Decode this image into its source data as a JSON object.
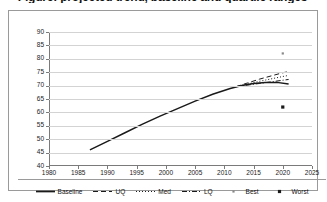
{
  "chart_data": {
    "type": "line",
    "title": "Figure: projected trend, baseline and quartile ranges",
    "xlabel": "",
    "ylabel": "",
    "xlim": [
      1980,
      2025
    ],
    "ylim": [
      40,
      90
    ],
    "grid": true,
    "legend_position": "bottom",
    "xticks": [
      "1980",
      "1985",
      "1990",
      "1995",
      "2000",
      "2005",
      "2010",
      "2015",
      "2020",
      "2025"
    ],
    "yticks": [
      "40",
      "45",
      "50",
      "55",
      "60",
      "65",
      "70",
      "75",
      "80",
      "85",
      "90"
    ],
    "series": [
      {
        "name": "Baseline",
        "style": "solid",
        "color": "#1a1a1a",
        "x": [
          1987,
          1990,
          1993,
          1996,
          1999,
          2002,
          2005,
          2008,
          2011,
          2013,
          2015,
          2017,
          2019,
          2021
        ],
        "values": [
          46.0,
          49.2,
          52.4,
          55.6,
          58.6,
          61.4,
          64.2,
          66.8,
          68.9,
          70.0,
          70.8,
          71.2,
          71.2,
          70.6
        ]
      },
      {
        "name": "UQ",
        "style": "dashed",
        "color": "#1a1a1a",
        "x": [
          2012,
          2014,
          2016,
          2018,
          2020,
          2021
        ],
        "values": [
          69.6,
          71.0,
          72.4,
          73.6,
          74.8,
          75.2
        ]
      },
      {
        "name": "Med",
        "style": "dotted",
        "color": "#1a1a1a",
        "x": [
          2012,
          2014,
          2016,
          2018,
          2020,
          2021
        ],
        "values": [
          69.6,
          70.6,
          71.6,
          72.5,
          73.4,
          73.8
        ]
      },
      {
        "name": "LQ",
        "style": "dash-dot",
        "color": "#1a1a1a",
        "x": [
          2012,
          2014,
          2016,
          2018,
          2020,
          2021
        ],
        "values": [
          69.6,
          70.2,
          70.8,
          71.4,
          72.0,
          72.3
        ]
      },
      {
        "name": "Best",
        "style": "marker-small-dot",
        "color": "#8a8a8a",
        "x": [
          2020
        ],
        "values": [
          82.0
        ]
      },
      {
        "name": "Worst",
        "style": "marker-dot",
        "color": "#1a1a1a",
        "x": [
          2020
        ],
        "values": [
          62.0
        ]
      }
    ],
    "legend": [
      {
        "label": "Baseline",
        "style": "solid"
      },
      {
        "label": "UQ",
        "style": "dashed"
      },
      {
        "label": "Med",
        "style": "dotted"
      },
      {
        "label": "LQ",
        "style": "dash-dot"
      },
      {
        "label": "Best",
        "style": "marker-small-dot"
      },
      {
        "label": "Worst",
        "style": "marker-dot"
      }
    ]
  }
}
